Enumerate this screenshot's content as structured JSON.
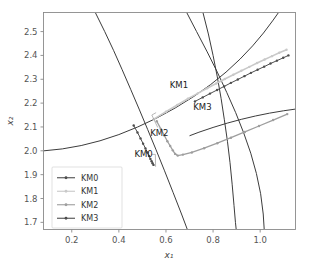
{
  "chart_data": {
    "type": "line",
    "title": "",
    "xlabel": "x₁",
    "ylabel": "x₂",
    "xlim": [
      0.08,
      1.15
    ],
    "ylim": [
      1.67,
      2.58
    ],
    "xticks": [
      "0.2",
      "0.4",
      "0.6",
      "0.8",
      "1.0"
    ],
    "xtick_values": [
      0.2,
      0.4,
      0.6,
      0.8,
      1.0
    ],
    "yticks": [
      "1.7",
      "1.8",
      "1.9",
      "2.0",
      "2.1",
      "2.2",
      "2.3",
      "2.4",
      "2.5"
    ],
    "ytick_values": [
      1.7,
      1.8,
      1.9,
      2.0,
      2.1,
      2.2,
      2.3,
      2.4,
      2.5
    ],
    "grid": false,
    "legend_position": "lower left",
    "series": [
      {
        "name": "KM0",
        "color": "#4d4d4d",
        "marker": "dot",
        "linewidth": 1.0,
        "points": [
          [
            0.463,
            2.106
          ],
          [
            0.479,
            2.077
          ],
          [
            0.492,
            2.052
          ],
          [
            0.503,
            2.03
          ],
          [
            0.513,
            2.01
          ],
          [
            0.521,
            1.993
          ],
          [
            0.528,
            1.978
          ],
          [
            0.534,
            1.966
          ],
          [
            0.539,
            1.956
          ],
          [
            0.543,
            1.948
          ],
          [
            0.547,
            1.941
          ]
        ]
      },
      {
        "name": "KM1",
        "color": "#c9c9c9",
        "marker": "dot",
        "linewidth": 1.6,
        "points": [
          [
            0.548,
            2.133
          ],
          [
            0.6,
            2.164
          ],
          [
            0.648,
            2.192
          ],
          [
            0.693,
            2.218
          ],
          [
            0.735,
            2.241
          ],
          [
            0.775,
            2.262
          ],
          [
            0.813,
            2.282
          ],
          [
            0.85,
            2.301
          ],
          [
            0.886,
            2.319
          ],
          [
            0.92,
            2.336
          ],
          [
            0.954,
            2.352
          ],
          [
            0.987,
            2.368
          ],
          [
            1.019,
            2.383
          ],
          [
            1.05,
            2.397
          ],
          [
            1.081,
            2.411
          ],
          [
            1.112,
            2.424
          ]
        ]
      },
      {
        "name": "KM2",
        "color": "#9e9e9e",
        "marker": "dot",
        "linewidth": 1.3,
        "points": [
          [
            0.561,
            2.124
          ],
          [
            0.578,
            2.092
          ],
          [
            0.593,
            2.064
          ],
          [
            0.606,
            2.04
          ],
          [
            0.618,
            2.02
          ],
          [
            0.629,
            2.002
          ],
          [
            0.639,
            1.987
          ],
          [
            0.65,
            1.98
          ],
          [
            0.672,
            1.984
          ],
          [
            0.71,
            1.993
          ],
          [
            0.762,
            2.011
          ],
          [
            0.818,
            2.032
          ],
          [
            0.876,
            2.055
          ],
          [
            0.935,
            2.079
          ],
          [
            0.995,
            2.104
          ],
          [
            1.055,
            2.129
          ],
          [
            1.115,
            2.154
          ]
        ]
      },
      {
        "name": "KM3",
        "color": "#4d4d4d",
        "marker": "dot",
        "linewidth": 1.0,
        "points": [
          [
            0.723,
            2.207
          ],
          [
            0.756,
            2.224
          ],
          [
            0.787,
            2.24
          ],
          [
            0.817,
            2.255
          ],
          [
            0.847,
            2.27
          ],
          [
            0.876,
            2.285
          ],
          [
            0.905,
            2.299
          ],
          [
            0.933,
            2.313
          ],
          [
            0.961,
            2.327
          ],
          [
            0.989,
            2.34
          ],
          [
            1.017,
            2.353
          ],
          [
            1.044,
            2.366
          ],
          [
            1.071,
            2.378
          ],
          [
            1.098,
            2.39
          ],
          [
            1.12,
            2.4
          ]
        ]
      }
    ],
    "constraint_curves": [
      {
        "name": "constraint-a",
        "points": [
          [
            0.3,
            2.58
          ],
          [
            0.34,
            2.5
          ],
          [
            0.378,
            2.42
          ],
          [
            0.414,
            2.34
          ],
          [
            0.45,
            2.258
          ],
          [
            0.486,
            2.175
          ],
          [
            0.522,
            2.09
          ],
          [
            0.558,
            2.004
          ],
          [
            0.594,
            1.916
          ],
          [
            0.63,
            1.826
          ],
          [
            0.666,
            1.735
          ],
          [
            0.69,
            1.672
          ]
        ]
      },
      {
        "name": "constraint-b",
        "points": [
          [
            0.082,
            2.0
          ],
          [
            0.16,
            2.008
          ],
          [
            0.24,
            2.022
          ],
          [
            0.32,
            2.042
          ],
          [
            0.4,
            2.068
          ],
          [
            0.48,
            2.1
          ],
          [
            0.56,
            2.137
          ],
          [
            0.64,
            2.18
          ],
          [
            0.72,
            2.229
          ],
          [
            0.79,
            2.278
          ],
          [
            0.855,
            2.33
          ],
          [
            0.915,
            2.385
          ],
          [
            0.968,
            2.44
          ],
          [
            1.014,
            2.494
          ],
          [
            1.055,
            2.548
          ],
          [
            1.078,
            2.58
          ]
        ]
      },
      {
        "name": "constraint-c",
        "points": [
          [
            0.757,
            2.58
          ],
          [
            0.78,
            2.49
          ],
          [
            0.8,
            2.4
          ],
          [
            0.818,
            2.31
          ],
          [
            0.834,
            2.22
          ],
          [
            0.848,
            2.13
          ],
          [
            0.861,
            2.04
          ],
          [
            0.872,
            1.95
          ],
          [
            0.881,
            1.86
          ],
          [
            0.889,
            1.77
          ],
          [
            0.895,
            1.7
          ],
          [
            0.898,
            1.672
          ]
        ]
      },
      {
        "name": "constraint-d",
        "points": [
          [
            0.688,
            2.58
          ],
          [
            0.73,
            2.5
          ],
          [
            0.775,
            2.415
          ],
          [
            0.818,
            2.33
          ],
          [
            0.858,
            2.245
          ],
          [
            0.896,
            2.16
          ],
          [
            0.93,
            2.075
          ],
          [
            0.96,
            1.99
          ],
          [
            0.984,
            1.905
          ],
          [
            1.002,
            1.82
          ],
          [
            1.013,
            1.735
          ],
          [
            1.017,
            1.672
          ]
        ]
      },
      {
        "name": "constraint-e",
        "points": [
          [
            1.15,
            2.175
          ],
          [
            1.1,
            2.168
          ],
          [
            1.04,
            2.158
          ],
          [
            0.98,
            2.146
          ],
          [
            0.92,
            2.132
          ],
          [
            0.86,
            2.116
          ],
          [
            0.8,
            2.098
          ],
          [
            0.74,
            2.078
          ],
          [
            0.7,
            2.063
          ]
        ]
      }
    ],
    "annotations": [
      {
        "name": "KM0",
        "label_x": 0.505,
        "label_y": 1.985,
        "leader": [
          [
            0.538,
            1.985
          ],
          [
            0.555,
            1.985
          ],
          [
            0.556,
            1.933
          ]
        ]
      },
      {
        "name": "KM1",
        "label_x": 0.655,
        "label_y": 2.275,
        "leader": []
      },
      {
        "name": "KM2",
        "label_x": 0.572,
        "label_y": 2.075,
        "leader": [
          [
            0.565,
            2.098
          ],
          [
            0.54,
            2.15
          ],
          [
            0.558,
            2.16
          ]
        ]
      },
      {
        "name": "KM3",
        "label_x": 0.755,
        "label_y": 2.185,
        "leader": []
      }
    ]
  },
  "legend": {
    "entries": [
      {
        "label": "KM0",
        "color": "#4d4d4d"
      },
      {
        "label": "KM1",
        "color": "#c9c9c9"
      },
      {
        "label": "KM2",
        "color": "#9e9e9e"
      },
      {
        "label": "KM3",
        "color": "#4d4d4d"
      }
    ]
  }
}
